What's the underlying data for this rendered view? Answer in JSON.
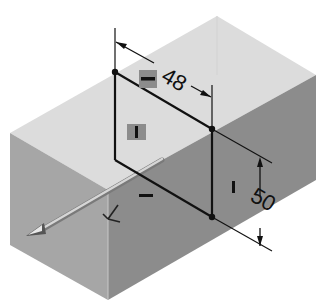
{
  "colors": {
    "background": "#ffffff",
    "top_face": "#dcdcdc",
    "left_face": "#a8a8a8",
    "right_face": "#8a8a8a",
    "sketch_line": "#111111",
    "constraint_badge": "#8c8c8c",
    "normal_arrow": "#b8b8b8"
  },
  "dimensions": {
    "horizontal": {
      "value": "48"
    },
    "vertical": {
      "value": "50"
    }
  },
  "constraints": {
    "horizontal_top": {
      "symbol": "—"
    },
    "vertical_left": {
      "symbol": "I"
    },
    "vertical_right": {
      "symbol": "I"
    },
    "horizontal_bottom": {
      "symbol": "—"
    }
  },
  "icons": {
    "normal_arrow": "extrude-direction-arrow-icon",
    "triad": "sketch-origin-triad-icon"
  }
}
